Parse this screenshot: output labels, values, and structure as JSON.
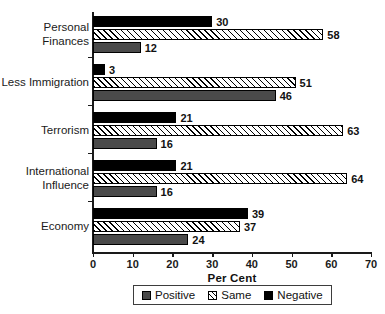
{
  "chart_data": {
    "type": "bar",
    "orientation": "horizontal",
    "title": "",
    "xlabel": "Per Cent",
    "ylabel": "",
    "xlim": [
      0,
      70
    ],
    "xticks": [
      0,
      10,
      20,
      30,
      40,
      50,
      60,
      70
    ],
    "grid": false,
    "legend_position": "bottom",
    "categories": [
      "Personal\nFinances",
      "Less Immigration",
      "Terrorism",
      "International\nInfluence",
      "Economy"
    ],
    "series": [
      {
        "name": "Negative",
        "color": "#000000",
        "pattern": "solid",
        "values": [
          30,
          3,
          21,
          21,
          39
        ]
      },
      {
        "name": "Same",
        "color": "#ffffff",
        "pattern": "hatch",
        "values": [
          58,
          51,
          63,
          64,
          37
        ]
      },
      {
        "name": "Positive",
        "color": "#4a4a4a",
        "pattern": "solid",
        "values": [
          12,
          46,
          16,
          16,
          24
        ]
      }
    ]
  },
  "axis": {
    "x_title": "Per Cent",
    "tick_labels": [
      "0",
      "10",
      "20",
      "30",
      "40",
      "50",
      "60",
      "70"
    ]
  },
  "category_labels": [
    "Personal\nFinances",
    "Less Immigration",
    "Terrorism",
    "International\nInfluence",
    "Economy"
  ],
  "bar_values": {
    "personal_finances": {
      "negative": "30",
      "same": "58",
      "positive": "12"
    },
    "less_immigration": {
      "negative": "3",
      "same": "51",
      "positive": "46"
    },
    "terrorism": {
      "negative": "21",
      "same": "63",
      "positive": "16"
    },
    "international_influence": {
      "negative": "21",
      "same": "64",
      "positive": "16"
    },
    "economy": {
      "negative": "39",
      "same": "37",
      "positive": "24"
    }
  },
  "legend": {
    "items": [
      {
        "label": "Positive",
        "swatch": "positive"
      },
      {
        "label": "Same",
        "swatch": "same"
      },
      {
        "label": "Negative",
        "swatch": "negative"
      }
    ]
  },
  "colors": {
    "negative": "#000000",
    "positive": "#4a4a4a",
    "same": "#ffffff",
    "axis": "#1a1a1a",
    "text": "#111111"
  }
}
